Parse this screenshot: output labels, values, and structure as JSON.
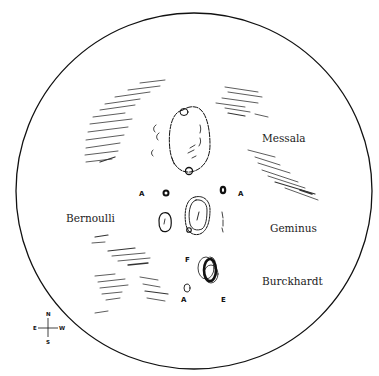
{
  "sketch": {
    "subject": "Lunar observation sketch",
    "labels": {
      "messala": "Messala",
      "bernoulli": "Bernoulli",
      "geminus": "Geminus",
      "burckhardt": "Burckhardt"
    },
    "crater_letters": {
      "bernoulli_a": "A",
      "messala_a": "A",
      "burckhardt_f": "F",
      "burckhardt_a": "A",
      "burckhardt_e": "E"
    },
    "compass": {
      "north": "N",
      "south": "S",
      "east": "E",
      "west": "W"
    },
    "colors": {
      "ink": "#111111",
      "background": "#ffffff"
    }
  }
}
